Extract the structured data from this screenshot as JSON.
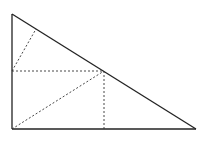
{
  "diagram": {
    "type": "geometry",
    "colors": {
      "stroke": "#222222",
      "background": "#ffffff"
    },
    "points": {
      "A": [
        12,
        14
      ],
      "B": [
        12,
        129
      ],
      "C": [
        196,
        129
      ],
      "M": [
        104,
        71
      ],
      "L": [
        12,
        71
      ],
      "F": [
        104,
        129
      ],
      "P": [
        36,
        29
      ]
    },
    "solid_segments": [
      [
        "A",
        "B"
      ],
      [
        "B",
        "C"
      ],
      [
        "A",
        "C"
      ]
    ],
    "dashed_segments": [
      [
        "L",
        "M"
      ],
      [
        "M",
        "F"
      ],
      [
        "B",
        "M"
      ],
      [
        "L",
        "P"
      ]
    ]
  }
}
